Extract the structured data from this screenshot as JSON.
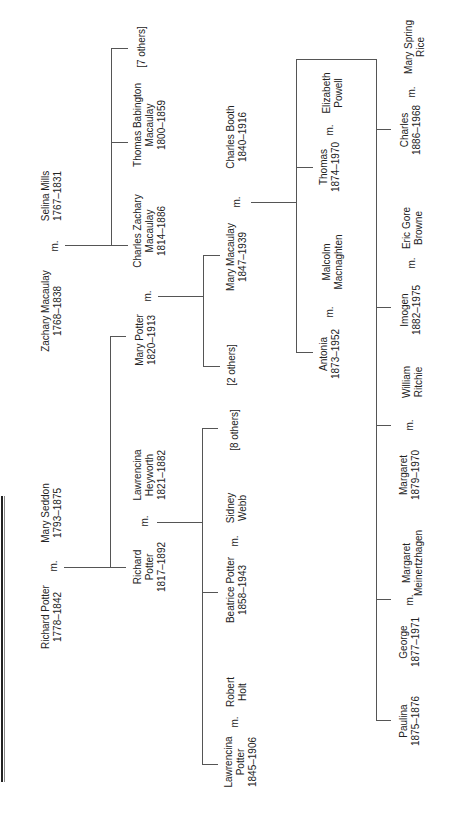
{
  "diagram": {
    "orientation": "rotated -90deg",
    "marriage_label": "m.",
    "people": {
      "zachary_macaulay": {
        "name": "Zachary Macaulay",
        "dates": "1768–1838"
      },
      "selina_mills": {
        "name": "Selina Mills",
        "dates": "1767–1831"
      },
      "richard_potter_sr": {
        "name": "Richard Potter",
        "dates": "1778–1842"
      },
      "mary_seddon": {
        "name": "Mary Seddon",
        "dates": "1793–1875"
      },
      "charles_zachary_macaulay": {
        "name": "Charles Zachary\nMacaulay",
        "dates": "1814–1886"
      },
      "thomas_babington_macaulay": {
        "name": "Thomas Babington\nMacaulay",
        "dates": "1800–1859"
      },
      "macaulay_others": {
        "name": "[7 others]"
      },
      "mary_potter": {
        "name": "Mary Potter",
        "dates": "1820–1913"
      },
      "richard_potter_jr": {
        "name": "Richard\nPotter",
        "dates": "1817–1892"
      },
      "lawrencina_heyworth": {
        "name": "Lawrencina\nHeyworth",
        "dates": "1821–1882"
      },
      "mary_macaulay": {
        "name": "Mary Macaulay",
        "dates": "1847–1939"
      },
      "charles_booth": {
        "name": "Charles Booth",
        "dates": "1840–1916"
      },
      "macaulay_children_others": {
        "name": "[2 others]"
      },
      "potter_others": {
        "name": "[8 others]"
      },
      "sidney_webb": {
        "name": "Sidney\nWebb"
      },
      "beatrice_potter": {
        "name": "Beatrice Potter",
        "dates": "1858–1943"
      },
      "robert_holt": {
        "name": "Robert\nHolt"
      },
      "lawrencina_potter": {
        "name": "Lawrencina\nPotter",
        "dates": "1845–1906"
      },
      "thomas_booth": {
        "name": "Thomas",
        "dates": "1874–1970"
      },
      "elizabeth_powell": {
        "name": "Elizabeth\nPowell"
      },
      "antonia_booth": {
        "name": "Antonia",
        "dates": "1873–1952"
      },
      "malcolm_macnaghten": {
        "name": "Malcolm\nMacnaghten"
      },
      "charles_booth_jr": {
        "name": "Charles",
        "dates": "1886–1968"
      },
      "mary_spring_rice": {
        "name": "Mary Spring\nRice"
      },
      "imogen_booth": {
        "name": "Imogen",
        "dates": "1882–1975"
      },
      "eric_gore_browne": {
        "name": "Eric Gore\nBrowne"
      },
      "margaret_booth": {
        "name": "Margaret",
        "dates": "1879–1970"
      },
      "william_ritchie": {
        "name": "William\nRitchie"
      },
      "george_booth": {
        "name": "George",
        "dates": "1877–1971"
      },
      "margaret_meinertzhagen": {
        "name": "Margaret\nMeinertzhagen"
      },
      "paulina_booth": {
        "name": "Paulina",
        "dates": "1875–1876"
      }
    },
    "labels": {
      "zachary_macaulay": "Zachary Macaulay\n1768–1838",
      "selina_mills": "Selina Mills\n1767–1831",
      "richard_potter_sr": "Richard Potter\n1778–1842",
      "mary_seddon": "Mary Seddon\n1793–1875",
      "charles_zachary_macaulay": "Charles Zachary\nMacaulay\n1814–1886",
      "thomas_babington_macaulay": "Thomas Babington\nMacaulay\n1800–1859",
      "macaulay_others": "[7 others]",
      "mary_potter": "Mary Potter\n1820–1913",
      "richard_potter_jr": "Richard\nPotter\n1817–1892",
      "lawrencina_heyworth": "Lawrencina\nHeyworth\n1821–1882",
      "mary_macaulay": "Mary Macaulay\n1847–1939",
      "charles_booth": "Charles Booth\n1840–1916",
      "macaulay_children_others": "[2 others]",
      "potter_others": "[8 others]",
      "sidney_webb": "Sidney\nWebb",
      "beatrice_potter": "Beatrice Potter\n1858–1943",
      "robert_holt": "Robert\nHolt",
      "lawrencina_potter": "Lawrencina\nPotter\n1845–1906",
      "thomas_booth": "Thomas\n1874–1970",
      "elizabeth_powell": "Elizabeth\nPowell",
      "antonia_booth": "Antonia\n1873–1952",
      "malcolm_macnaghten": "Malcolm\nMacnaghten",
      "charles_booth_jr": "Charles\n1886–1968",
      "mary_spring_rice": "Mary Spring\nRice",
      "imogen_booth": "Imogen\n1882–1975",
      "eric_gore_browne": "Eric Gore\nBrowne",
      "margaret_booth": "Margaret\n1879–1970",
      "william_ritchie": "William\nRitchie",
      "george_booth": "George\n1877–1971",
      "margaret_meinertzhagen": "Margaret\nMeinertzhagen",
      "paulina_booth": "Paulina\n1875–1876"
    },
    "marriages": [
      [
        "zachary_macaulay",
        "selina_mills"
      ],
      [
        "richard_potter_sr",
        "mary_seddon"
      ],
      [
        "mary_potter",
        "charles_zachary_macaulay"
      ],
      [
        "richard_potter_jr",
        "lawrencina_heyworth"
      ],
      [
        "mary_macaulay",
        "charles_booth"
      ],
      [
        "beatrice_potter",
        "sidney_webb"
      ],
      [
        "lawrencina_potter",
        "robert_holt"
      ],
      [
        "thomas_booth",
        "elizabeth_powell"
      ],
      [
        "antonia_booth",
        "malcolm_macnaghten"
      ],
      [
        "charles_booth_jr",
        "mary_spring_rice"
      ],
      [
        "imogen_booth",
        "eric_gore_browne"
      ],
      [
        "margaret_booth",
        "william_ritchie"
      ],
      [
        "george_booth",
        "margaret_meinertzhagen"
      ]
    ],
    "colors": {
      "line": "#555555",
      "text": "#222222",
      "background": "#ffffff"
    }
  }
}
